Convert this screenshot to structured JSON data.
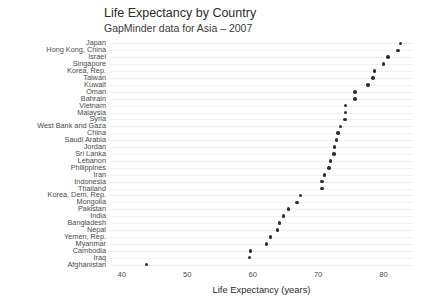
{
  "chart_data": {
    "type": "scatter",
    "title": "Life Expectancy by Country",
    "subtitle": "GapMinder data for Asia – 2007",
    "xlabel": "Life Expectancy (years)",
    "ylabel": "",
    "xlim": [
      38.2,
      84.5
    ],
    "xticks": [
      40,
      50,
      60,
      70,
      80
    ],
    "grid": "horizontal",
    "legend": "none",
    "orientation": "horizontal-dot-plot",
    "sort": "descending by value",
    "categories": [
      "Japan",
      "Hong Kong, China",
      "Israel",
      "Singapore",
      "Korea, Rep.",
      "Taiwan",
      "Kuwait",
      "Oman",
      "Bahrain",
      "Vietnam",
      "Malaysia",
      "Syria",
      "West Bank and Gaza",
      "China",
      "Saudi Arabia",
      "Jordan",
      "Sri Lanka",
      "Lebanon",
      "Philippines",
      "Iran",
      "Indonesia",
      "Thailand",
      "Korea, Dem. Rep.",
      "Mongolia",
      "Pakistan",
      "India",
      "Bangladesh",
      "Nepal",
      "Yemen, Rep.",
      "Myanmar",
      "Cambodia",
      "Iraq",
      "Afghanistan"
    ],
    "values": [
      82.6,
      82.2,
      80.7,
      80.0,
      78.6,
      78.4,
      77.6,
      75.6,
      75.6,
      74.2,
      74.2,
      74.1,
      73.4,
      73.0,
      72.8,
      72.5,
      72.4,
      71.9,
      71.7,
      71.0,
      70.6,
      70.6,
      67.3,
      66.8,
      65.5,
      64.7,
      64.1,
      63.8,
      62.7,
      62.1,
      59.7,
      59.5,
      43.8
    ]
  },
  "axis": {
    "xtick_labels": [
      "40",
      "50",
      "60",
      "70",
      "80"
    ]
  }
}
